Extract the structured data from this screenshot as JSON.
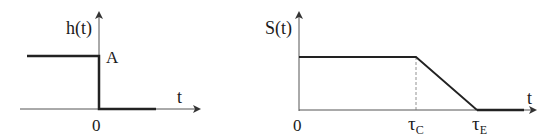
{
  "left_plot": {
    "y_label": "h(t)",
    "x_label": "t",
    "level_label": "A",
    "origin_label": "0"
  },
  "right_plot": {
    "y_label": "S(t)",
    "x_label": "t",
    "origin_label": "0",
    "tick_c": {
      "base": "τ",
      "sub": "C"
    },
    "tick_e": {
      "base": "τ",
      "sub": "E"
    }
  },
  "colors": {
    "axis": "#555555",
    "curve": "#222222"
  }
}
